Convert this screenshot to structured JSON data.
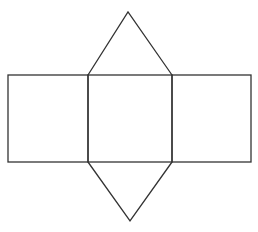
{
  "diagram": {
    "type": "net",
    "stroke_color": "#333333",
    "background": "#ffffff",
    "rectangles": [
      {
        "name": "left-rectangle",
        "x": 8,
        "y": 75,
        "w": 80,
        "h": 87
      },
      {
        "name": "middle-rectangle",
        "x": 88,
        "y": 75,
        "w": 84,
        "h": 87
      },
      {
        "name": "right-rectangle",
        "x": 172,
        "y": 75,
        "w": 79,
        "h": 87
      }
    ],
    "triangles": [
      {
        "name": "top-triangle",
        "points": "88,75 128,12 172,75"
      },
      {
        "name": "bottom-triangle",
        "points": "88,162 130,221 172,162"
      }
    ]
  }
}
